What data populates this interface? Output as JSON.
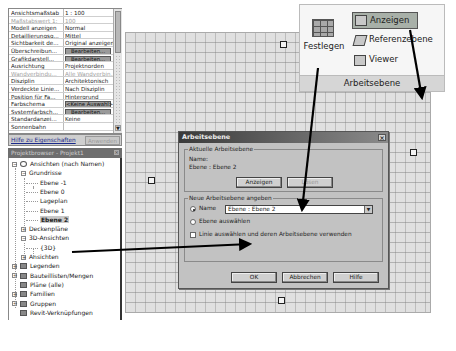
{
  "properties": {
    "rows": [
      {
        "key": "Ansichtsmaßstab",
        "value": "1 : 100",
        "type": "text",
        "dim": false
      },
      {
        "key": "Maßstabswert 1:",
        "value": "100",
        "type": "text",
        "dim": true
      },
      {
        "key": "Modell anzeigen",
        "value": "Normal",
        "type": "text",
        "dim": false
      },
      {
        "key": "Detaillierungsg...",
        "value": "Mittel",
        "type": "text",
        "dim": false
      },
      {
        "key": "Sichtbarkeit de...",
        "value": "Original anzeigen",
        "type": "text",
        "dim": false
      },
      {
        "key": "Überschreibun...",
        "value": "Bearbeiten...",
        "type": "button",
        "dim": false
      },
      {
        "key": "Grafikdarstell...",
        "value": "Bearbeiten...",
        "type": "button",
        "dim": false
      },
      {
        "key": "Ausrichtung",
        "value": "Projektnorden",
        "type": "text",
        "dim": false
      },
      {
        "key": "Wandverbindu...",
        "value": "Alle Wandverbin...",
        "type": "text",
        "dim": true
      },
      {
        "key": "Disziplin",
        "value": "Architektonisch",
        "type": "text",
        "dim": false
      },
      {
        "key": "Verdeckte Linie...",
        "value": "Nach Disziplin",
        "type": "text",
        "dim": false
      },
      {
        "key": "Position für Fa...",
        "value": "Hintergrund",
        "type": "text",
        "dim": false
      },
      {
        "key": "Farbschema",
        "value": "<Keine Auswahl>",
        "type": "button",
        "dim": false
      },
      {
        "key": "Systemfarbsch...",
        "value": "Bearbeiten...",
        "type": "button",
        "dim": false
      },
      {
        "key": "Standardanzei...",
        "value": "Keine",
        "type": "text",
        "dim": false
      },
      {
        "key": "Sonnenbahn",
        "value": "",
        "type": "text",
        "dim": false
      }
    ],
    "help_link": "Hilfe zu Eigenschaften",
    "apply_label": "Anwenden",
    "scroll_down": "▼"
  },
  "browser": {
    "title": "Projektbrowser - Projekt1",
    "close": "×",
    "items": [
      {
        "label": "Ansichten (nach Namen)",
        "level": 0,
        "expander": "−"
      },
      {
        "label": "Grundrisse",
        "level": 1,
        "expander": "−"
      },
      {
        "label": "Ebene -1",
        "level": 2
      },
      {
        "label": "Ebene 0",
        "level": 2
      },
      {
        "label": "Lageplan",
        "level": 2
      },
      {
        "label": "Ebene 1",
        "level": 2
      },
      {
        "label": "Ebene 2",
        "level": 2,
        "selected": true
      },
      {
        "label": "Deckenpläne",
        "level": 1,
        "expander": "+"
      },
      {
        "label": "3D-Ansichten",
        "level": 1,
        "expander": "−"
      },
      {
        "label": "{3D}",
        "level": 2
      },
      {
        "label": "Ansichten",
        "level": 1,
        "expander": "+"
      },
      {
        "label": "Legenden",
        "level": 0,
        "expander": "+",
        "icon": true
      },
      {
        "label": "Bauteillisten/Mengen",
        "level": 0,
        "expander": "+",
        "icon": true
      },
      {
        "label": "Pläne (alle)",
        "level": 0,
        "icon": true
      },
      {
        "label": "Familien",
        "level": 0,
        "expander": "+",
        "icon": true
      },
      {
        "label": "Gruppen",
        "level": 0,
        "expander": "+",
        "icon": true
      },
      {
        "label": "Revit-Verknüpfungen",
        "level": 0,
        "icon": true
      }
    ]
  },
  "ribbon": {
    "panel_title": "Arbeitsebene",
    "festlegen": "Festlegen",
    "anzeigen": "Anzeigen",
    "referenzebene": "Referenzebene",
    "viewer": "Viewer"
  },
  "dialog": {
    "title": "Arbeitsebene",
    "close": "×",
    "current_group_label": "Aktuelle Arbeitsebene",
    "name_label": "Name:",
    "current_name": "Ebene : Ebene 2",
    "show_button": "Anzeigen",
    "release_button": "Lösen",
    "new_group_label": "Neue Arbeitsebene angeben",
    "option_name": "Name",
    "name_select_value": "Ebene : Ebene 2",
    "option_pick_plane": "Ebene auswählen",
    "option_pick_line": "Linie auswählen und deren Arbeitsebene verwenden",
    "ok_button": "OK",
    "cancel_button": "Abbrechen",
    "help_button": "Hilfe"
  },
  "colors": {
    "dialog_bg": "#c2c2c2",
    "canvas_bg": "#e0e0e0",
    "highlight": "#a8b0a8",
    "title_dark": "#3a3a3a"
  }
}
